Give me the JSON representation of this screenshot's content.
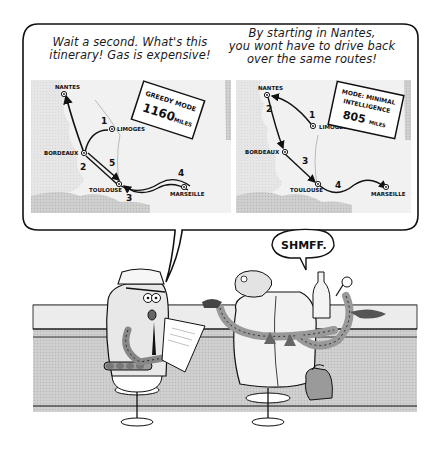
{
  "comic": {
    "speech_bubble": {
      "left_panel": {
        "caption_line1": "Wait a second. What's this",
        "caption_line2": "itinerary! Gas is expensive!",
        "mode_box": {
          "line1": "GREEDY MODE",
          "line2": "1160",
          "line3": "MILES"
        },
        "cities": {
          "nantes": "NANTES",
          "limoges": "LIMOGES",
          "bordeaux": "BORDEAUX",
          "toulouse": "TOULOUSE",
          "marseille": "MARSEILLE"
        },
        "steps": [
          "1",
          "2",
          "3",
          "4",
          "5"
        ]
      },
      "right_panel": {
        "caption_line1": "By starting in Nantes,",
        "caption_line2": "you wont have to drive back",
        "caption_line3": "over the same routes!",
        "mode_box": {
          "line1": "MODE: MINIMAL",
          "line2": "INTELLIGENCE",
          "line3": "805",
          "line4": "MILES"
        },
        "cities": {
          "nantes": "NANTES",
          "limoges": "LIMOGES",
          "bordeaux": "BORDEAUX",
          "toulouse": "TOULOUSE",
          "marseille": "MARSEILLE"
        },
        "steps": [
          "1",
          "2",
          "3",
          "4"
        ]
      }
    },
    "sound_bubble": {
      "text": "SHMFF."
    },
    "colors": {
      "ink": "#111111",
      "paper": "#ffffff",
      "map_land": "#ebebeb",
      "map_sea": "#c8c8c8",
      "counter": "#d9d9d9",
      "counter_shadow": "#bdbdbd"
    }
  }
}
